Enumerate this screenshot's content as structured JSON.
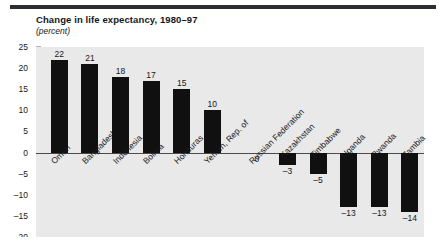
{
  "chart_data": {
    "type": "bar",
    "title": "Change in life expectancy, 1980–97",
    "subtitle": "(percent)",
    "xlabel": "",
    "ylabel": "",
    "ylim": [
      -20,
      25
    ],
    "yticks": [
      25,
      20,
      15,
      10,
      5,
      0,
      -5,
      -10,
      -15,
      -20
    ],
    "ytick_labels": [
      "25",
      "20",
      "15",
      "10",
      "5",
      "0",
      "–5",
      "–10",
      "–15",
      "–20"
    ],
    "grid": false,
    "legend": "none",
    "gap_after_index": 5,
    "categories": [
      "Oman",
      "Bangladesh",
      "Indonesia",
      "Bolivia",
      "Honduras",
      "Yemen, Rep. of",
      "Russian Federation",
      "Kazakhstan",
      "Zimbabwe",
      "Uganda",
      "Rwanda",
      "Zambia"
    ],
    "values": [
      22,
      21,
      18,
      17,
      15,
      10,
      0,
      -3,
      -5,
      -13,
      -13,
      -14
    ],
    "value_labels": [
      "22",
      "21",
      "18",
      "17",
      "15",
      "10",
      "0",
      "–3",
      "–5",
      "–13",
      "–13",
      "–14"
    ],
    "bar_color": "#101010",
    "plot_background": "#e9e9e9",
    "axis_color": "#4a4a4a"
  }
}
